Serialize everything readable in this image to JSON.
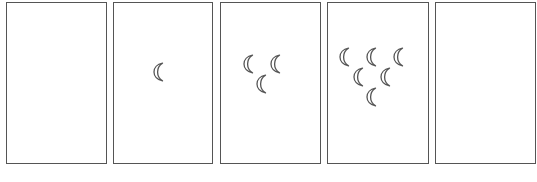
{
  "diagram": {
    "type": "sequence-puzzle",
    "panel_count": 5,
    "stroke_color": "#555555",
    "icon": "crescent-moon-icon",
    "panels": [
      {
        "index": 1,
        "left": 6,
        "width": 101,
        "moon_count": 0,
        "moons": []
      },
      {
        "index": 2,
        "left": 113,
        "width": 100,
        "moon_count": 1,
        "moons": [
          [
            45,
            69
          ]
        ]
      },
      {
        "index": 3,
        "left": 220,
        "width": 101,
        "moon_count": 3,
        "moons": [
          [
            28,
            61
          ],
          [
            55,
            61
          ],
          [
            41,
            81
          ]
        ]
      },
      {
        "index": 4,
        "left": 327,
        "width": 102,
        "moon_count": 6,
        "moons": [
          [
            17,
            54
          ],
          [
            44,
            54
          ],
          [
            71,
            54
          ],
          [
            31,
            74
          ],
          [
            58,
            74
          ],
          [
            44,
            94
          ]
        ]
      },
      {
        "index": 5,
        "left": 435,
        "width": 101,
        "moon_count": 0,
        "moons": []
      }
    ]
  }
}
